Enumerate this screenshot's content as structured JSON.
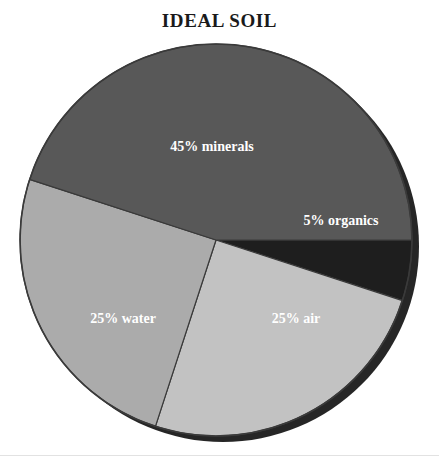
{
  "figure": {
    "title": "IDEAL SOIL",
    "background_color": "#ffffff",
    "rule_color": "#e2e2e2"
  },
  "chart_data": {
    "type": "pie",
    "title": "IDEAL SOIL",
    "xlabel": "",
    "ylabel": "",
    "total": 100,
    "units": "percent",
    "legend_position": "none",
    "labels_inside_slices": true,
    "start_angle_deg": 0,
    "direction": "clockwise",
    "categories": [
      "organics",
      "air",
      "water",
      "minerals"
    ],
    "values": [
      5,
      25,
      25,
      45
    ],
    "slices": [
      {
        "name": "organics",
        "value": 5,
        "label": "5% organics",
        "color": "#1e1e1e",
        "label_color": "#ffffff",
        "start_deg": 0,
        "end_deg": 18,
        "label_x": 341,
        "label_y": 222
      },
      {
        "name": "air",
        "value": 25,
        "label": "25% air",
        "color": "#c2c2c2",
        "label_color": "#ffffff",
        "start_deg": 18,
        "end_deg": 108,
        "label_x": 296,
        "label_y": 320
      },
      {
        "name": "water",
        "value": 25,
        "label": "25% water",
        "color": "#ababab",
        "label_color": "#ffffff",
        "start_deg": 108,
        "end_deg": 198,
        "label_x": 123,
        "label_y": 320
      },
      {
        "name": "minerals",
        "value": 45,
        "label": "45% minerals",
        "color": "#585858",
        "label_color": "#ffffff",
        "start_deg": 198,
        "end_deg": 360,
        "label_x": 212,
        "label_y": 148
      }
    ],
    "geometry": {
      "center_x": 216,
      "center_y": 240,
      "radius": 196,
      "shadow_offset_x": 7,
      "shadow_offset_y": 6,
      "shadow_color": "#262626",
      "outline_color": "#3a3a3a"
    }
  }
}
